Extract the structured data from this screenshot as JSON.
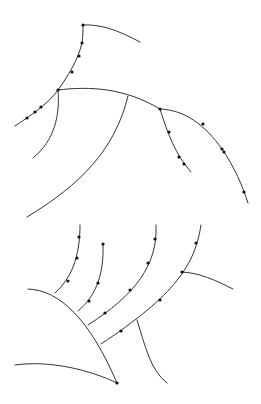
{
  "diagram": {
    "type": "branching-line-tracings",
    "width": 261,
    "height": 404,
    "colors": {
      "background": "#ffffff",
      "stroke": "#333333",
      "node": "#111111"
    },
    "top_structure": {
      "paths": [
        {
          "name": "top-hook",
          "d": "M83,25 C100,24 118,30 140,42"
        },
        {
          "name": "main-ascending-stem",
          "d": "M15,126 C30,116 48,104 58,90 C68,76 78,60 82,43 C83,35 83,30 83,25"
        },
        {
          "name": "main-horizontal-branch",
          "d": "M58,90 C90,86 125,88 160,109"
        },
        {
          "name": "short-descending-branch",
          "d": "M58,90 C60,115 55,140 33,158"
        },
        {
          "name": "long-descending-branch",
          "d": "M128,96 C115,150 80,185 27,217"
        },
        {
          "name": "middle-side-branch",
          "d": "M160,109 C168,135 176,155 191,172"
        },
        {
          "name": "right-long-branch",
          "d": "M160,109 C185,110 205,125 222,149 C235,168 242,185 248,203"
        }
      ],
      "nodes": [
        [
          83,
          25
        ],
        [
          82,
          43
        ],
        [
          79,
          56
        ],
        [
          72,
          72
        ],
        [
          58,
          90
        ],
        [
          41,
          107
        ],
        [
          35,
          112
        ],
        [
          27,
          118
        ],
        [
          160,
          109
        ],
        [
          169,
          132
        ],
        [
          179,
          157
        ],
        [
          184,
          164
        ],
        [
          203,
          124
        ],
        [
          222,
          149
        ],
        [
          224,
          152
        ],
        [
          244,
          192
        ]
      ]
    },
    "bottom_structure": {
      "paths": [
        {
          "name": "big-arc",
          "d": "M28,289 C60,290 90,320 117,383"
        },
        {
          "name": "bottom-curve",
          "d": "M15,365 C50,360 90,370 117,383"
        },
        {
          "name": "branch-1",
          "d": "M80,225 C80,250 75,275 55,293"
        },
        {
          "name": "branch-2",
          "d": "M103,244 C104,270 98,295 78,311"
        },
        {
          "name": "branch-3",
          "d": "M156,225 C158,265 135,295 88,325"
        },
        {
          "name": "branch-4",
          "d": "M201,225 C195,265 175,295 101,344"
        },
        {
          "name": "right-side-branch",
          "d": "M182,272 C200,273 215,280 233,289"
        },
        {
          "name": "down-branch",
          "d": "M137,320 C145,345 150,370 167,383"
        }
      ],
      "nodes": [
        [
          79,
          237
        ],
        [
          77,
          258
        ],
        [
          68,
          281
        ],
        [
          103,
          244
        ],
        [
          98,
          283
        ],
        [
          89,
          301
        ],
        [
          155,
          239
        ],
        [
          148,
          263
        ],
        [
          130,
          290
        ],
        [
          105,
          313
        ],
        [
          196,
          243
        ],
        [
          182,
          272
        ],
        [
          160,
          300
        ],
        [
          121,
          331
        ],
        [
          117,
          383
        ]
      ]
    }
  }
}
